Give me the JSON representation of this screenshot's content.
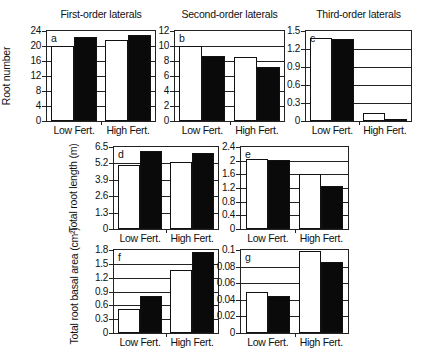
{
  "chart_data": [
    {
      "id": "a",
      "type": "bar",
      "title": "First-order laterals",
      "ylabel": "Root number",
      "xlabel": "",
      "categories": [
        "Low Fert.",
        "High Fert."
      ],
      "ylim": [
        0,
        24
      ],
      "yticks": [
        "0",
        "4",
        "8",
        "12",
        "16",
        "20",
        "24"
      ],
      "series": [
        {
          "name": "white",
          "color": "#ffffff",
          "values": [
            20,
            21.5
          ]
        },
        {
          "name": "black",
          "color": "#000000",
          "values": [
            22.5,
            23
          ]
        }
      ],
      "grid": true,
      "legend": "none"
    },
    {
      "id": "b",
      "type": "bar",
      "title": "Second-order laterals",
      "ylabel": "",
      "xlabel": "",
      "categories": [
        "Low Fert.",
        "High Fert."
      ],
      "ylim": [
        0,
        12
      ],
      "yticks": [
        "0",
        "2",
        "4",
        "6",
        "8",
        "10",
        "12"
      ],
      "series": [
        {
          "name": "white",
          "color": "#ffffff",
          "values": [
            10,
            8.6
          ]
        },
        {
          "name": "black",
          "color": "#000000",
          "values": [
            8.7,
            7.2
          ]
        }
      ],
      "grid": true,
      "legend": "none"
    },
    {
      "id": "c",
      "type": "bar",
      "title": "Third-order laterals",
      "ylabel": "",
      "xlabel": "",
      "categories": [
        "Low Fert.",
        "High Fert."
      ],
      "ylim": [
        0,
        1.5
      ],
      "yticks": [
        "0",
        "0.3",
        "0.6",
        "0.9",
        "1.2",
        "1.5"
      ],
      "series": [
        {
          "name": "white",
          "color": "#ffffff",
          "values": [
            1.38,
            0.13
          ]
        },
        {
          "name": "black",
          "color": "#000000",
          "values": [
            1.36,
            0.03
          ]
        }
      ],
      "grid": true,
      "legend": "none"
    },
    {
      "id": "d",
      "type": "bar",
      "title": "",
      "ylabel": "Total root length (m)",
      "xlabel": "",
      "categories": [
        "Low Fert.",
        "High Fert."
      ],
      "ylim": [
        0,
        6.5
      ],
      "yticks": [
        "0",
        "1.3",
        "2.6",
        "3.9",
        "5.2",
        "6.5"
      ],
      "series": [
        {
          "name": "white",
          "color": "#ffffff",
          "values": [
            5.1,
            5.3
          ]
        },
        {
          "name": "black",
          "color": "#000000",
          "values": [
            6.2,
            6.0
          ]
        }
      ],
      "grid": true,
      "legend": "none"
    },
    {
      "id": "e",
      "type": "bar",
      "title": "",
      "ylabel": "",
      "xlabel": "",
      "categories": [
        "Low Fert.",
        "High Fert."
      ],
      "ylim": [
        0,
        2.4
      ],
      "yticks": [
        "0",
        "0.4",
        "0.8",
        "1.2",
        "1.6",
        "2",
        "2.4"
      ],
      "series": [
        {
          "name": "white",
          "color": "#ffffff",
          "values": [
            2.05,
            1.62
          ]
        },
        {
          "name": "black",
          "color": "#000000",
          "values": [
            2.03,
            1.26
          ]
        }
      ],
      "grid": true,
      "legend": "none"
    },
    {
      "id": "f",
      "type": "bar",
      "title": "",
      "ylabel": "Total root basal area (cm²)",
      "xlabel": "",
      "categories": [
        "Low Fert.",
        "High Fert."
      ],
      "ylim": [
        0,
        1.8
      ],
      "yticks": [
        "0",
        "0.3",
        "0.6",
        "0.9",
        "1.2",
        "1.5",
        "1.8"
      ],
      "series": [
        {
          "name": "white",
          "color": "#ffffff",
          "values": [
            0.53,
            1.36
          ]
        },
        {
          "name": "black",
          "color": "#000000",
          "values": [
            0.81,
            1.75
          ]
        }
      ],
      "grid": true,
      "legend": "none"
    },
    {
      "id": "g",
      "type": "bar",
      "title": "",
      "ylabel": "",
      "xlabel": "",
      "categories": [
        "Low Fert.",
        "High Fert."
      ],
      "ylim": [
        0,
        0.1
      ],
      "yticks": [
        "0",
        "0.02",
        "0.04",
        "0.06",
        "0.08",
        "0.1"
      ],
      "series": [
        {
          "name": "white",
          "color": "#ffffff",
          "values": [
            0.049,
            0.099
          ]
        },
        {
          "name": "black",
          "color": "#000000",
          "values": [
            0.044,
            0.085
          ]
        }
      ],
      "grid": true,
      "legend": "none"
    }
  ],
  "layout": [
    {
      "id": "a",
      "left": 46,
      "top": 30,
      "width": 110,
      "height": 92
    },
    {
      "id": "b",
      "left": 174,
      "top": 30,
      "width": 111,
      "height": 92
    },
    {
      "id": "c",
      "left": 305,
      "top": 30,
      "width": 107,
      "height": 92
    },
    {
      "id": "d",
      "left": 113,
      "top": 146,
      "width": 106,
      "height": 84
    },
    {
      "id": "e",
      "left": 240,
      "top": 146,
      "width": 109,
      "height": 84
    },
    {
      "id": "f",
      "left": 113,
      "top": 249,
      "width": 106,
      "height": 85
    },
    {
      "id": "g",
      "left": 240,
      "top": 249,
      "width": 109,
      "height": 85
    }
  ]
}
